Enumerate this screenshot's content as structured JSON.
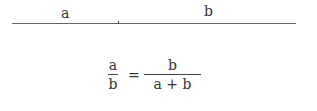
{
  "diagram": {
    "segment_labels": {
      "left": "a",
      "right": "b"
    },
    "equation": {
      "lhs": {
        "numerator": "a",
        "denominator": "b"
      },
      "operator": "=",
      "rhs": {
        "numerator": "b",
        "denominator": "a + b"
      }
    }
  }
}
